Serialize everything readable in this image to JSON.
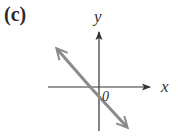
{
  "figure": {
    "panel_label": "(c)",
    "x_axis_label": "x",
    "y_axis_label": "y",
    "origin_label": "0",
    "colors": {
      "axes": "#333333",
      "line": "#8a8a8a",
      "text": "#2a2a2a"
    }
  }
}
